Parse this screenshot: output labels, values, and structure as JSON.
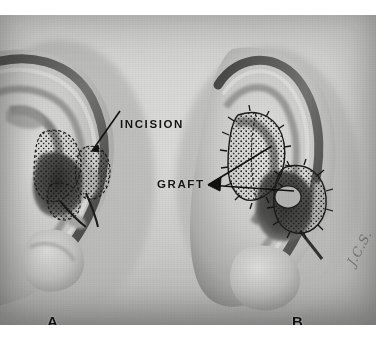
{
  "figure": {
    "kind": "medical-illustration",
    "colorspace": "grayscale",
    "background_color": "#ffffff",
    "plate_color": "#c9c9c7",
    "ink_color": "#141414"
  },
  "annotations": {
    "incision_label": "INCISION",
    "graft_label": "GRAFT"
  },
  "panels": [
    {
      "letter": "A.",
      "caption_letter": "A.",
      "description": "left ear with stippled incision markings"
    },
    {
      "letter": "B.",
      "caption_letter": "B.",
      "description": "right ear with sutured grafts in place"
    }
  ],
  "credit": {
    "signature": "J.C.S."
  }
}
